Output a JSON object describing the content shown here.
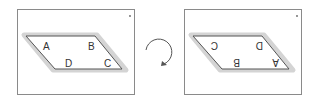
{
  "left_panel": {
    "vertices": {
      "top_left": "A",
      "top_right": "B",
      "bottom_left": "D",
      "bottom_right": "C"
    }
  },
  "right_panel": {
    "vertices": {
      "top_left": "C",
      "top_right": "D",
      "bottom_left": "B",
      "bottom_right": "A"
    },
    "note": "labels rotated 180 degrees"
  },
  "arrow": {
    "type": "rotation",
    "direction": "clockwise"
  },
  "colors": {
    "outline": "#555555",
    "shadow": "#d0d0d0",
    "frame": "#8a8a8a"
  }
}
